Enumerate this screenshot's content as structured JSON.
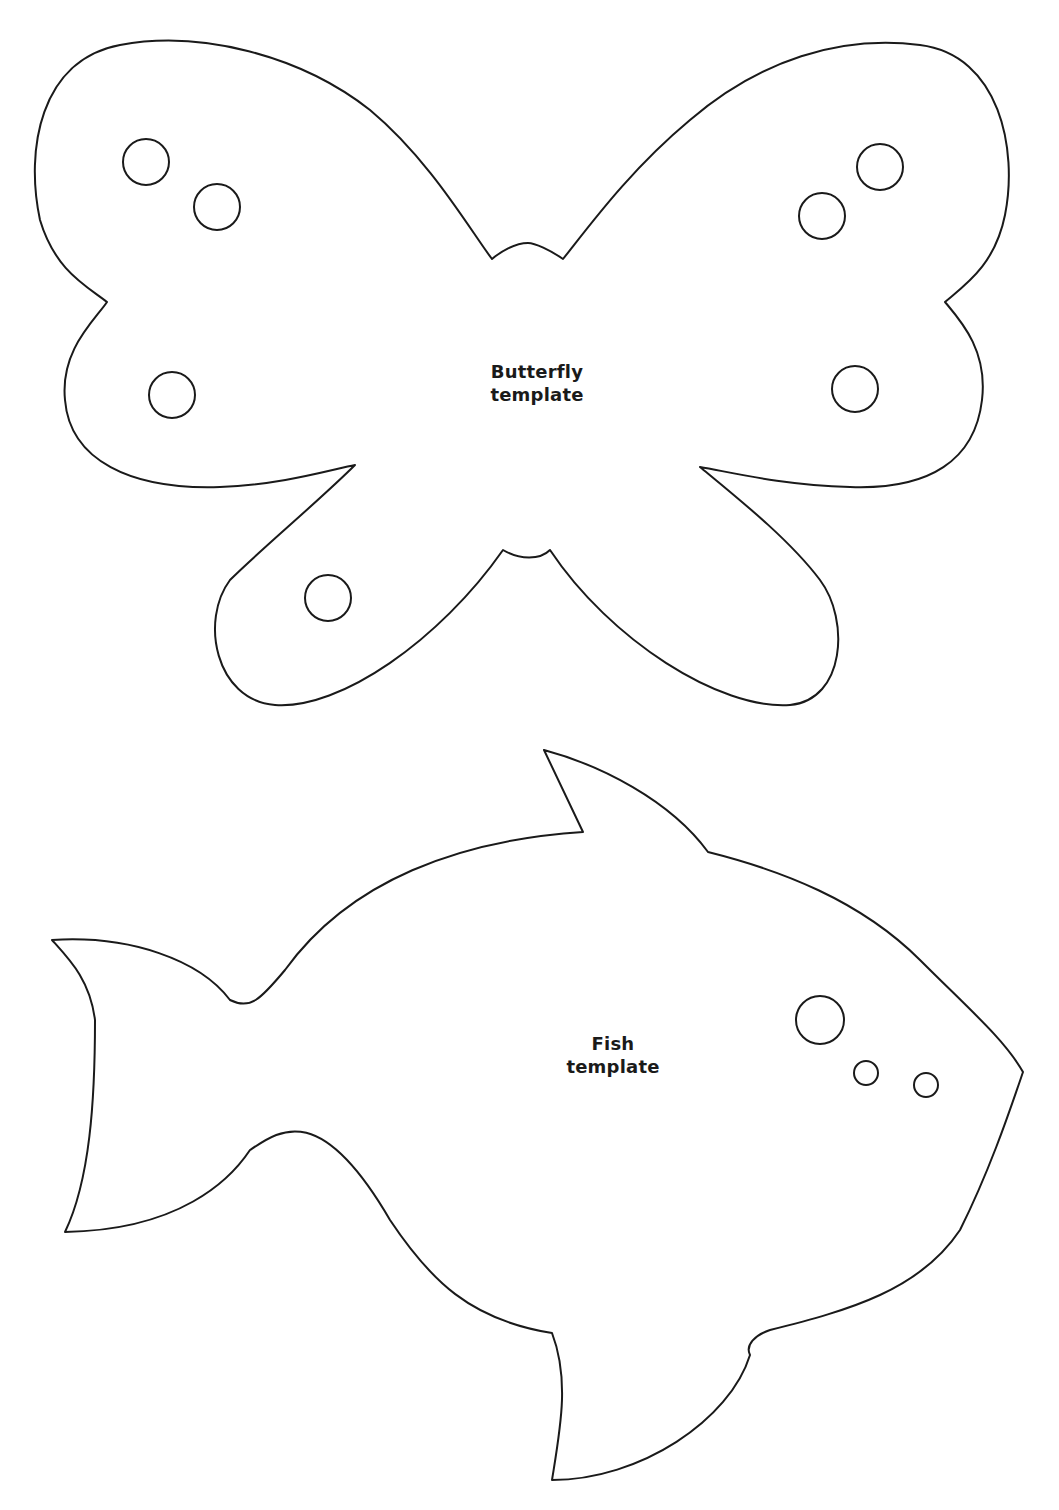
{
  "page": {
    "background": "#ffffff",
    "stroke_color": "#1a1a1a"
  },
  "templates": [
    {
      "id": "butterfly",
      "label_line1": "Butterfly",
      "label_line2": "template",
      "spots": 6
    },
    {
      "id": "fish",
      "label_line1": "Fish",
      "label_line2": "template",
      "spots": 3
    }
  ]
}
